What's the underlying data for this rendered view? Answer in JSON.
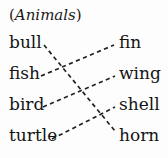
{
  "title": {
    "open_paren": "(",
    "word": "Animals",
    "close_paren": ")",
    "full": "(Animals)"
  },
  "exercise": {
    "kind": "matching-pairs",
    "instruction_category": "Animals",
    "connector_style": "dashed"
  },
  "left_column": {
    "items": [
      {
        "label": "bull",
        "x": 9,
        "y": 32
      },
      {
        "label": "fish",
        "x": 9,
        "y": 63
      },
      {
        "label": "bird",
        "x": 9,
        "y": 94
      },
      {
        "label": "turtle",
        "x": 9,
        "y": 125
      }
    ]
  },
  "right_column": {
    "items": [
      {
        "label": "fin",
        "x": 119,
        "y": 32
      },
      {
        "label": "wing",
        "x": 119,
        "y": 63
      },
      {
        "label": "shell",
        "x": 119,
        "y": 94
      },
      {
        "label": "horn",
        "x": 119,
        "y": 125
      }
    ]
  },
  "connections": [
    {
      "from": "bull",
      "to": "horn",
      "x1": 44,
      "y1": 45,
      "x2": 115,
      "y2": 131
    },
    {
      "from": "fish",
      "to": "fin",
      "x1": 41,
      "y1": 76,
      "x2": 114,
      "y2": 45
    },
    {
      "from": "bird",
      "to": "wing",
      "x1": 43,
      "y1": 107,
      "x2": 115,
      "y2": 76
    },
    {
      "from": "turtle",
      "to": "shell",
      "x1": 52,
      "y1": 139,
      "x2": 115,
      "y2": 107
    }
  ],
  "colors": {
    "background": "#fdfdfd",
    "text": "#141414",
    "connector": "#222222"
  }
}
